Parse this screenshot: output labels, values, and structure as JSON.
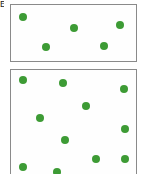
{
  "figure": {
    "width": 144,
    "height": 174,
    "background_color": "#ffffff",
    "corner_label": "E",
    "panel_border_color": "#8a8a8a",
    "panel_fill_color": "#fefefe",
    "dot_color": "#3d9b35",
    "dot_diameter": 8
  },
  "chart_data": {
    "type": "scatter",
    "title": "",
    "subtitle": "",
    "xlabel": "",
    "ylabel": "",
    "grid": false,
    "legend": null,
    "annotations": [],
    "panels": [
      {
        "name": "top-panel",
        "label": "",
        "marker_count": 5,
        "density": "low",
        "box_px": {
          "x": 10,
          "y": 4,
          "width": 127,
          "height": 58
        },
        "xlim": [
          0,
          127
        ],
        "ylim": [
          0,
          58
        ],
        "points": [
          {
            "x": 12,
            "y": 12
          },
          {
            "x": 35,
            "y": 42
          },
          {
            "x": 63,
            "y": 23
          },
          {
            "x": 93,
            "y": 41
          },
          {
            "x": 109,
            "y": 20
          }
        ]
      },
      {
        "name": "bottom-panel",
        "label": "",
        "marker_count": 11,
        "density": "high",
        "box_px": {
          "x": 10,
          "y": 69,
          "width": 127,
          "height": 110
        },
        "xlim": [
          0,
          127
        ],
        "ylim": [
          0,
          110
        ],
        "points": [
          {
            "x": 12,
            "y": 10
          },
          {
            "x": 52,
            "y": 13
          },
          {
            "x": 113,
            "y": 19
          },
          {
            "x": 75,
            "y": 36
          },
          {
            "x": 29,
            "y": 48
          },
          {
            "x": 114,
            "y": 59
          },
          {
            "x": 54,
            "y": 70
          },
          {
            "x": 85,
            "y": 89
          },
          {
            "x": 114,
            "y": 89
          },
          {
            "x": 12,
            "y": 97
          },
          {
            "x": 46,
            "y": 102
          }
        ]
      }
    ]
  }
}
